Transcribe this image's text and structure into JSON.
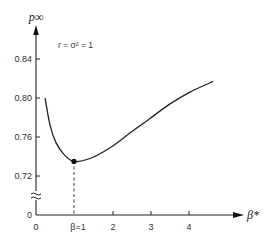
{
  "chart_data": {
    "type": "line",
    "title": "",
    "xlabel": "β*",
    "ylabel": "p∞",
    "annotation": "r = σ² = 1",
    "x_ticks": [
      "0",
      "β=1",
      "2",
      "3",
      "4"
    ],
    "x_tick_values": [
      0,
      1,
      2,
      3,
      4
    ],
    "y_ticks": [
      "0",
      "0.72",
      "0.76",
      "0.80",
      "0.84"
    ],
    "y_tick_values": [
      0,
      0.72,
      0.76,
      0.8,
      0.84
    ],
    "y_axis_break": true,
    "xlim": [
      0,
      5.4
    ],
    "ylim": [
      0.7,
      0.86
    ],
    "grid": false,
    "legend": null,
    "series": [
      {
        "name": "p∞(β*)",
        "x": [
          0.24,
          0.37,
          0.53,
          0.74,
          1.0,
          1.42,
          1.95,
          2.47,
          3.0,
          3.53,
          4.05,
          4.66
        ],
        "y": [
          0.8,
          0.772,
          0.754,
          0.742,
          0.735,
          0.738,
          0.749,
          0.764,
          0.779,
          0.794,
          0.806,
          0.817
        ]
      }
    ],
    "marked_point": {
      "x": 1.0,
      "y": 0.735,
      "label": "β=1",
      "dashed_drop_line": true
    }
  }
}
